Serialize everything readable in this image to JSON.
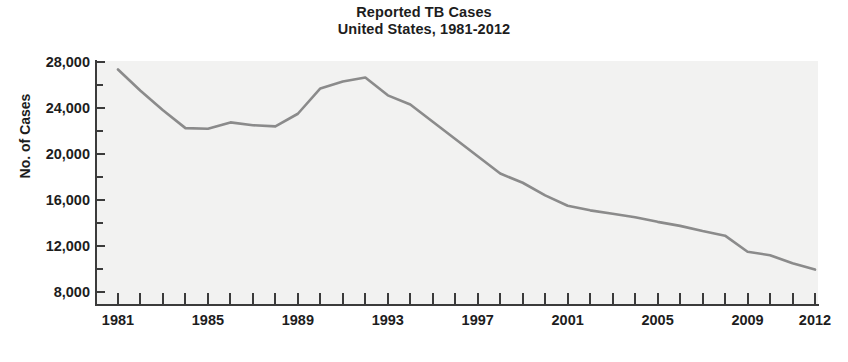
{
  "chart_data": {
    "type": "line",
    "title": "Reported TB Cases",
    "subtitle": "United States, 1981-2012",
    "title_lines": [
      "Reported TB Cases",
      "United States, 1981-2012"
    ],
    "xlabel": "",
    "ylabel": "No. of Cases",
    "xlim": [
      1981,
      2012
    ],
    "ylim": [
      8000,
      28000
    ],
    "grid": false,
    "legend": null,
    "y_ticks_major": [
      28000,
      24000,
      20000,
      16000,
      12000,
      8000
    ],
    "y_tick_labels": [
      "28,000",
      "24,000",
      "20,000",
      "16,000",
      "12,000",
      "8,000"
    ],
    "y_ticks_minor": [
      26000,
      22000,
      18000,
      14000,
      10000
    ],
    "x_ticks": [
      1981,
      1982,
      1983,
      1984,
      1985,
      1986,
      1987,
      1988,
      1989,
      1990,
      1991,
      1992,
      1993,
      1994,
      1995,
      1996,
      1997,
      1998,
      1999,
      2000,
      2001,
      2002,
      2003,
      2004,
      2005,
      2006,
      2007,
      2008,
      2009,
      2010,
      2011,
      2012
    ],
    "x_tick_labels": [
      "1981",
      "1985",
      "1989",
      "1993",
      "1997",
      "2001",
      "2005",
      "2009",
      "2012"
    ],
    "x_tick_label_years": [
      1981,
      1985,
      1989,
      1993,
      1997,
      2001,
      2005,
      2009,
      2012
    ],
    "series": [
      {
        "name": "Reported TB Cases",
        "color": "#8b8b8b",
        "x": [
          1981,
          1982,
          1983,
          1984,
          1985,
          1986,
          1987,
          1988,
          1989,
          1990,
          1991,
          1992,
          1993,
          1994,
          1995,
          1996,
          1997,
          1998,
          1999,
          2000,
          2001,
          2002,
          2003,
          2004,
          2005,
          2006,
          2007,
          2008,
          2009,
          2010,
          2011,
          2012
        ],
        "values": [
          27350,
          25500,
          23800,
          22250,
          22200,
          22750,
          22500,
          22400,
          23500,
          25700,
          26300,
          26650,
          25100,
          24300,
          22800,
          21300,
          19800,
          18300,
          17500,
          16400,
          15500,
          15100,
          14800,
          14500,
          14100,
          13750,
          13300,
          12900,
          11500,
          11200,
          10500,
          9950
        ]
      }
    ],
    "annotations": []
  }
}
